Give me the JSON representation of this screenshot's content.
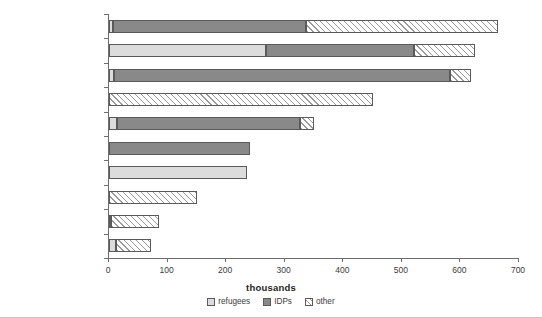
{
  "chart_data": {
    "type": "bar",
    "orientation": "horizontal",
    "stacked": true,
    "title": "",
    "xlabel": "thousands",
    "ylabel": "",
    "xlim": [
      0,
      700
    ],
    "xticks": [
      0,
      100,
      200,
      300,
      400,
      500,
      600,
      700
    ],
    "xtick_labels": [
      "0",
      "100",
      "200",
      "300",
      "400",
      "500",
      "600",
      "700"
    ],
    "grid": false,
    "legend_position": "bottom-center",
    "categories": [
      "Russian Fed.",
      "Serbia and Montenegro",
      "Azerbaijan",
      "Latvia",
      "Bosnia and Herzegovina",
      "Georgia",
      "Armenia",
      "Estonia",
      "Ukraine",
      "Kazakhstan"
    ],
    "series": [
      {
        "name": "refugees",
        "color": "#dcdcdc",
        "fill": "solid-light-gray",
        "values": [
          6,
          268,
          9,
          0,
          14,
          0,
          235,
          0,
          4,
          12
        ]
      },
      {
        "name": "IDPs",
        "color": "#898989",
        "fill": "solid-dark-gray",
        "values": [
          331,
          252,
          573,
          0,
          312,
          240,
          0,
          0,
          0,
          0
        ]
      },
      {
        "name": "other",
        "color": "#ffffff",
        "fill": "diagonal-hatch",
        "values": [
          328,
          105,
          36,
          450,
          24,
          0,
          0,
          150,
          81,
          60
        ]
      }
    ],
    "totals": [
      665,
      625,
      618,
      450,
      350,
      240,
      235,
      150,
      85,
      72
    ]
  },
  "legend": {
    "items": [
      {
        "label": "refugees",
        "swatch": "refugees"
      },
      {
        "label": "IDPs",
        "swatch": "idps"
      },
      {
        "label": "other",
        "swatch": "other"
      }
    ]
  },
  "axis": {
    "x_title": "thousands"
  }
}
